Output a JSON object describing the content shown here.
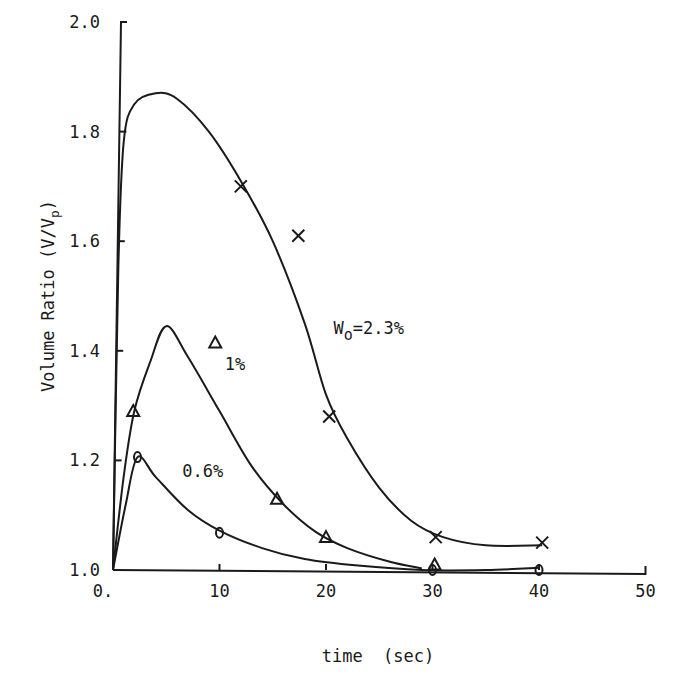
{
  "chart_data": {
    "type": "line",
    "title": "",
    "xlabel": "time  (sec)",
    "ylabel": "Volume Ratio (V/V",
    "ylabel_sub": "p",
    "ylabel_close": ")",
    "xlim": [
      0,
      50
    ],
    "ylim": [
      1.0,
      2.0
    ],
    "x_ticks": [
      0,
      10,
      20,
      30,
      40,
      50
    ],
    "x_tick_labels": [
      "0.",
      "10",
      "20",
      "30",
      "40",
      "50"
    ],
    "y_ticks": [
      1.0,
      1.2,
      1.4,
      1.6,
      1.8,
      2.0
    ],
    "y_tick_labels": [
      "1.0",
      "1.2",
      "1.4",
      "1.6",
      "1.8",
      "2.0"
    ],
    "grid": false,
    "legend": "inline annotations",
    "series": [
      {
        "name": "W0=2.3%",
        "label_main": "W",
        "label_sub": "o",
        "label_rest": "=2.3%",
        "marker": "x",
        "points": [
          [
            12.0,
            1.7
          ],
          [
            17.4,
            1.61
          ],
          [
            20.3,
            1.28
          ],
          [
            30.3,
            1.06
          ],
          [
            40.3,
            1.05
          ]
        ],
        "curve": [
          [
            0,
            1.0
          ],
          [
            0.5,
            1.55
          ],
          [
            1.0,
            1.78
          ],
          [
            2.0,
            1.85
          ],
          [
            4.0,
            1.87
          ],
          [
            6.0,
            1.86
          ],
          [
            9.0,
            1.8
          ],
          [
            12.0,
            1.71
          ],
          [
            15.0,
            1.6
          ],
          [
            18.0,
            1.45
          ],
          [
            20.0,
            1.32
          ],
          [
            22.0,
            1.24
          ],
          [
            25.0,
            1.15
          ],
          [
            28.0,
            1.09
          ],
          [
            31.0,
            1.06
          ],
          [
            35.0,
            1.045
          ],
          [
            40.3,
            1.045
          ]
        ]
      },
      {
        "name": "1%",
        "label_main": "1%",
        "marker": "triangle",
        "points": [
          [
            1.9,
            1.29
          ],
          [
            9.6,
            1.415
          ],
          [
            15.4,
            1.13
          ],
          [
            20.0,
            1.06
          ],
          [
            30.2,
            1.01
          ]
        ],
        "curve": [
          [
            0,
            1.0
          ],
          [
            1.0,
            1.17
          ],
          [
            2.0,
            1.29
          ],
          [
            3.5,
            1.38
          ],
          [
            5.0,
            1.445
          ],
          [
            7.0,
            1.39
          ],
          [
            10.0,
            1.29
          ],
          [
            13.0,
            1.19
          ],
          [
            16.0,
            1.12
          ],
          [
            19.0,
            1.07
          ],
          [
            22.0,
            1.04
          ],
          [
            26.0,
            1.015
          ],
          [
            29.0,
            1.003
          ]
        ]
      },
      {
        "name": "0.6%",
        "label_main": "0.6%",
        "marker": "circle",
        "points": [
          [
            2.3,
            1.206
          ],
          [
            10.0,
            1.068
          ],
          [
            30.0,
            1.0
          ],
          [
            40.0,
            1.0
          ]
        ],
        "curve": [
          [
            0,
            1.0
          ],
          [
            1.2,
            1.12
          ],
          [
            2.3,
            1.206
          ],
          [
            4.0,
            1.17
          ],
          [
            7.0,
            1.11
          ],
          [
            10.0,
            1.072
          ],
          [
            14.0,
            1.04
          ],
          [
            18.0,
            1.02
          ],
          [
            23.0,
            1.008
          ],
          [
            29.0,
            1.0
          ],
          [
            35.0,
            1.0
          ],
          [
            40.0,
            1.004
          ]
        ]
      }
    ],
    "annotations": [
      {
        "text": "W0=2.3%",
        "x": 20.7,
        "y": 1.43
      },
      {
        "text": "1%",
        "x": 10.5,
        "y": 1.365
      },
      {
        "text": "0.6%",
        "x": 6.5,
        "y": 1.17
      }
    ]
  }
}
